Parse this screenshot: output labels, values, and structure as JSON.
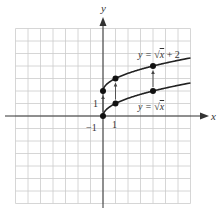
{
  "chart_data": {
    "type": "line",
    "title": "",
    "xlabel": "x",
    "ylabel": "y",
    "xlim": [
      -7,
      7
    ],
    "ylim": [
      -7,
      7
    ],
    "grid": true,
    "tick_labels": {
      "x_one": "1",
      "y_one": "1",
      "neg_one": "−1"
    },
    "series": [
      {
        "name": "y = √x",
        "label_prefix": "y = ",
        "label_expr": "x",
        "points": [
          [
            0,
            0
          ],
          [
            1,
            1
          ],
          [
            4,
            2
          ]
        ]
      },
      {
        "name": "y = √x + 2",
        "label_prefix": "y = ",
        "label_expr": "x",
        "label_suffix": " + 2",
        "points": [
          [
            0,
            2
          ],
          [
            1,
            3
          ],
          [
            4,
            4
          ]
        ]
      }
    ],
    "annotations": [
      {
        "type": "arrow",
        "from": [
          0,
          0
        ],
        "to": [
          0,
          2
        ]
      },
      {
        "type": "arrow",
        "from": [
          1,
          1
        ],
        "to": [
          1,
          3
        ]
      },
      {
        "type": "arrow",
        "from": [
          4,
          2
        ],
        "to": [
          4,
          4
        ]
      }
    ],
    "colors": {
      "grid": "#cccccc",
      "axis": "#333333",
      "curve": "#222222"
    }
  }
}
